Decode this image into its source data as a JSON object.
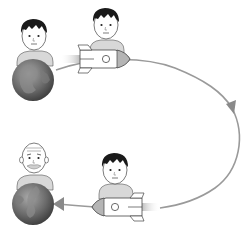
{
  "figure": {
    "description": "Twin paradox illustration: one twin stays on Earth while the other travels by rocket along a looping path and returns; the Earth twin has aged, the rocket twin remains young.",
    "scenes": [
      {
        "id": "earth-start",
        "label": "Young twin on Earth (departure)"
      },
      {
        "id": "rocket-outbound",
        "label": "Young twin riding rocket outbound"
      },
      {
        "id": "rocket-return",
        "label": "Young twin riding rocket on return"
      },
      {
        "id": "earth-end",
        "label": "Aged twin on Earth (arrival)"
      }
    ],
    "path": {
      "label": "Trajectory loop",
      "direction": "clockwise"
    }
  },
  "colors": {
    "background": "#ffffff",
    "path": "#9a9a9a",
    "arrowhead": "#8a8a8a",
    "earth_dark": "#4a4a4a",
    "earth_light": "#9b9b9b",
    "skin": "#ffffff",
    "hair": "#1a1a1a",
    "shirt": "#d8d8d8",
    "rocket_body": "#ffffff",
    "rocket_nose": "#b5b5b5",
    "exhaust": "#c8c8c8"
  }
}
